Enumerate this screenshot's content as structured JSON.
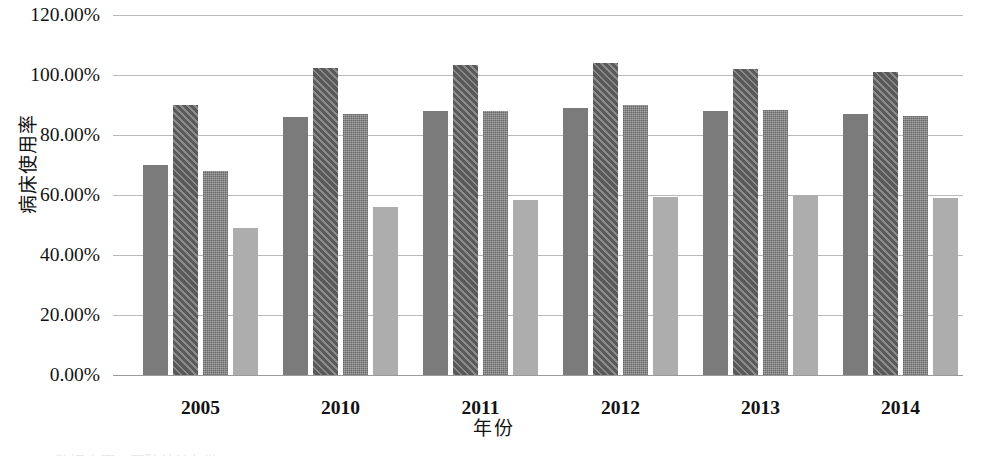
{
  "chart_data": {
    "type": "bar",
    "title": "",
    "xlabel": "年份",
    "ylabel": "病床使用率",
    "categories": [
      "2005",
      "2010",
      "2011",
      "2012",
      "2013",
      "2014"
    ],
    "ylim": [
      0,
      120
    ],
    "ytick_labels": [
      "0.00%",
      "20.00%",
      "40.00%",
      "60.00%",
      "80.00%",
      "100.00%",
      "120.00%"
    ],
    "ytick_values": [
      0,
      20,
      40,
      60,
      80,
      100,
      120
    ],
    "grid": true,
    "legend": "none",
    "series": [
      {
        "name": "series-1",
        "style": "solid-dark-gray",
        "color": "#7b7b7b",
        "values": [
          70,
          86,
          88,
          89,
          88,
          87
        ]
      },
      {
        "name": "series-2",
        "style": "diagonal-hatch",
        "color": "#6a6a6a",
        "values": [
          90,
          102.5,
          103.5,
          104,
          102,
          101
        ]
      },
      {
        "name": "series-3",
        "style": "checker-texture",
        "color": "#8a8a8a",
        "values": [
          68,
          87,
          88,
          90,
          88.5,
          86.5
        ]
      },
      {
        "name": "series-4",
        "style": "solid-light-gray",
        "color": "#adadad",
        "values": [
          49,
          56,
          58.5,
          59.5,
          60,
          59
        ]
      }
    ]
  },
  "axis": {
    "y_title": "病床使用率",
    "x_title": "年份"
  },
  "caption": {
    "clipped_text": "数据来源：医院统计年鉴"
  }
}
